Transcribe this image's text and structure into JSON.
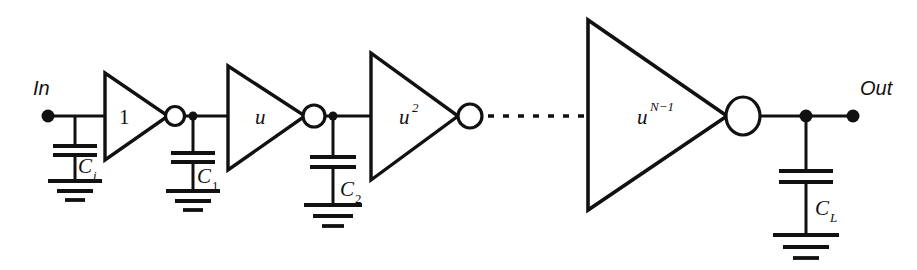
{
  "diagram": {
    "type": "schematic",
    "ports": {
      "input_label": "In",
      "output_label": "Out"
    },
    "stages": [
      {
        "id": "stage-1",
        "gain_base": "1",
        "gain_exponent": "",
        "load_cap": "C",
        "load_cap_sub": "i"
      },
      {
        "id": "stage-2",
        "gain_base": "u",
        "gain_exponent": "",
        "load_cap": "C",
        "load_cap_sub": "1"
      },
      {
        "id": "stage-3",
        "gain_base": "u",
        "gain_exponent": "2",
        "load_cap": "C",
        "load_cap_sub": "2"
      },
      {
        "id": "stage-n",
        "gain_base": "u",
        "gain_exponent": "N−1",
        "load_cap": "C",
        "load_cap_sub": "L"
      }
    ],
    "ellipsis": "· · · · · · ·",
    "colors": {
      "ink": "#111111",
      "background": "#ffffff"
    }
  }
}
